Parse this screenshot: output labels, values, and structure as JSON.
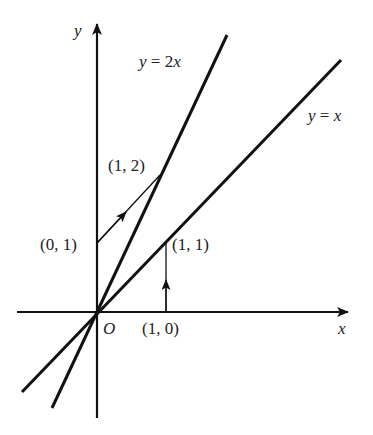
{
  "figure": {
    "axes": {
      "x_label": "x",
      "y_label": "y",
      "origin_label": "O"
    },
    "lines": [
      {
        "label": "y = 2x",
        "slope": 2
      },
      {
        "label": "y = x",
        "slope": 1
      }
    ],
    "points": [
      {
        "label": "(0, 1)"
      },
      {
        "label": "(1, 2)"
      },
      {
        "label": "(1, 1)"
      },
      {
        "label": "(1, 0)"
      }
    ],
    "arrows": [
      {
        "from": "(0, 1)",
        "to": "(1, 2)"
      },
      {
        "from": "(1, 0)",
        "to": "(1, 1)"
      }
    ],
    "colors": {
      "stroke": "#111111",
      "text": "#222222",
      "background": "#ffffff"
    }
  }
}
